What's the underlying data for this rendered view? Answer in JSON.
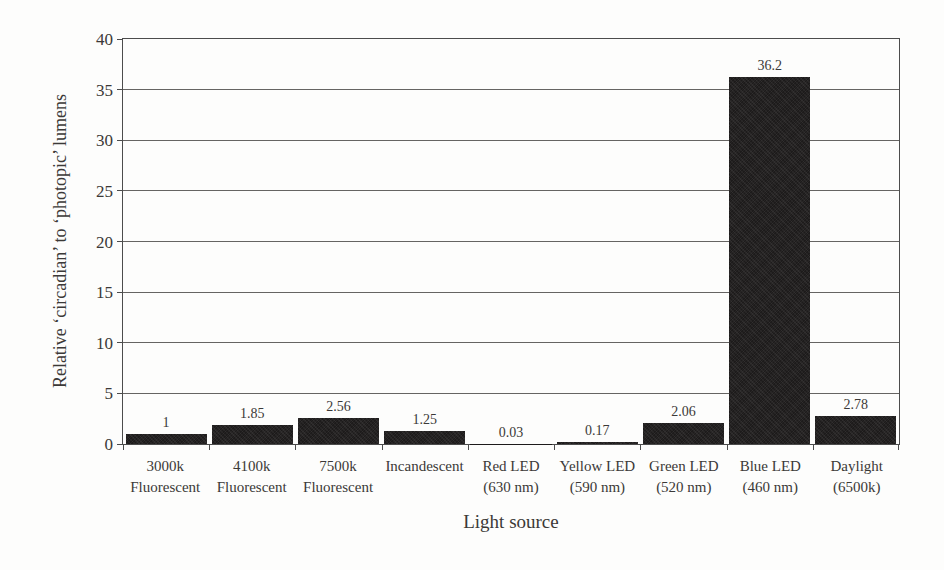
{
  "chart_data": {
    "type": "bar",
    "title": "",
    "xlabel": "Light source",
    "ylabel": "Relative ‘circadian’ to ‘photopic’ lumens",
    "ylim": [
      0,
      40
    ],
    "yticks": [
      0,
      5,
      10,
      15,
      20,
      25,
      30,
      35,
      40
    ],
    "grid": true,
    "legend_position": "none",
    "categories": [
      "3000k Fluorescent",
      "4100k Fluorescent",
      "7500k Fluorescent",
      "Incandescent",
      "Red LED (630 nm)",
      "Yellow LED (590 nm)",
      "Green LED (520 nm)",
      "Blue LED (460 nm)",
      "Daylight (6500k)"
    ],
    "category_label_lines": [
      [
        "3000k",
        "Fluorescent"
      ],
      [
        "4100k",
        "Fluorescent"
      ],
      [
        "7500k",
        "Fluorescent"
      ],
      [
        "Incandescent"
      ],
      [
        "Red LED",
        "(630 nm)"
      ],
      [
        "Yellow LED",
        "(590 nm)"
      ],
      [
        "Green LED",
        "(520 nm)"
      ],
      [
        "Blue LED",
        "(460 nm)"
      ],
      [
        "Daylight",
        "(6500k)"
      ]
    ],
    "values": [
      1,
      1.85,
      2.56,
      1.25,
      0.03,
      0.17,
      2.06,
      36.2,
      2.78
    ],
    "value_labels": [
      "1",
      "1.85",
      "2.56",
      "1.25",
      "0.03",
      "0.17",
      "2.06",
      "36.2",
      "2.78"
    ],
    "colors": {
      "bar": "#1d1b1b",
      "gridline": "#666462",
      "axis_frame": "#4c4c4c",
      "text": "#3b3937",
      "background": "#fdfdfc"
    }
  }
}
